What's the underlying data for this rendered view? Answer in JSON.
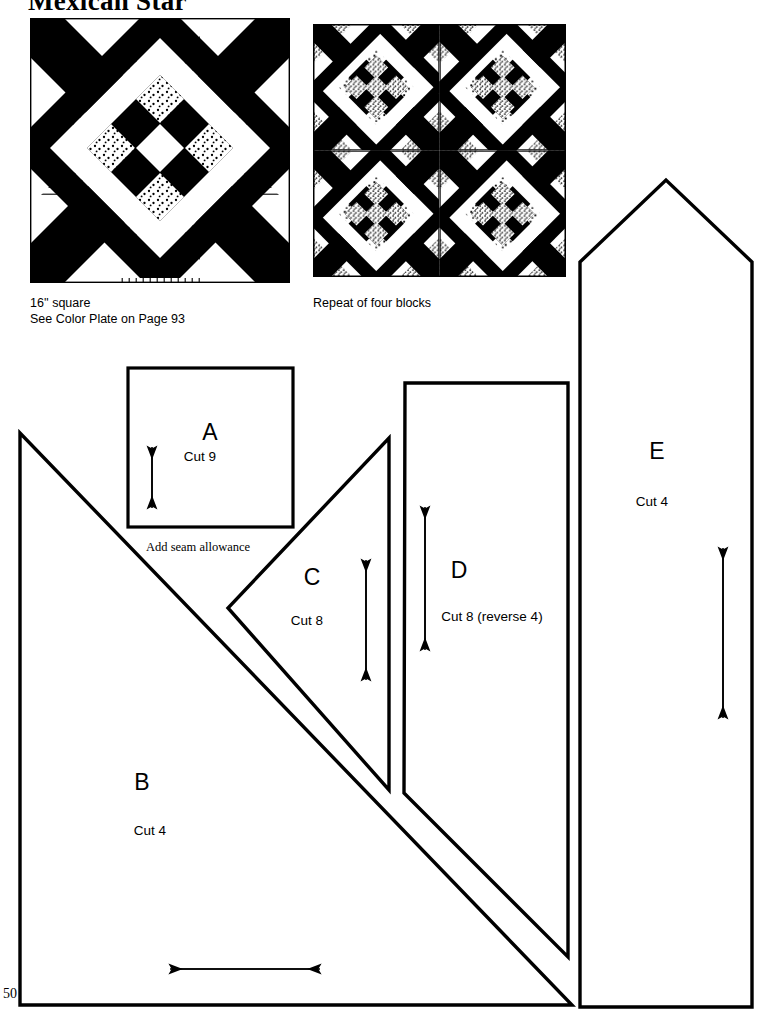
{
  "page": {
    "title": "Mexican Star",
    "number": "50"
  },
  "blocks": [
    {
      "name": "single-block",
      "caption_lines": [
        "16'' square",
        "See Color Plate on Page 93"
      ]
    },
    {
      "name": "four-block-repeat",
      "caption_lines": [
        "Repeat of four blocks"
      ]
    }
  ],
  "pieces": [
    {
      "id": "A",
      "letter": "A",
      "cut": "Cut 9",
      "grain": "vertical"
    },
    {
      "id": "B",
      "letter": "B",
      "cut": "Cut 4",
      "grain": "horizontal"
    },
    {
      "id": "C",
      "letter": "C",
      "cut": "Cut 8",
      "grain": "vertical"
    },
    {
      "id": "D",
      "letter": "D",
      "cut": "Cut 8  (reverse 4)",
      "grain": "vertical"
    },
    {
      "id": "E",
      "letter": "E",
      "cut": "Cut 4",
      "grain": "vertical"
    }
  ],
  "notes": {
    "seam_allowance": "Add seam allowance"
  },
  "colors": {
    "ink": "#000000",
    "paper": "#ffffff"
  }
}
